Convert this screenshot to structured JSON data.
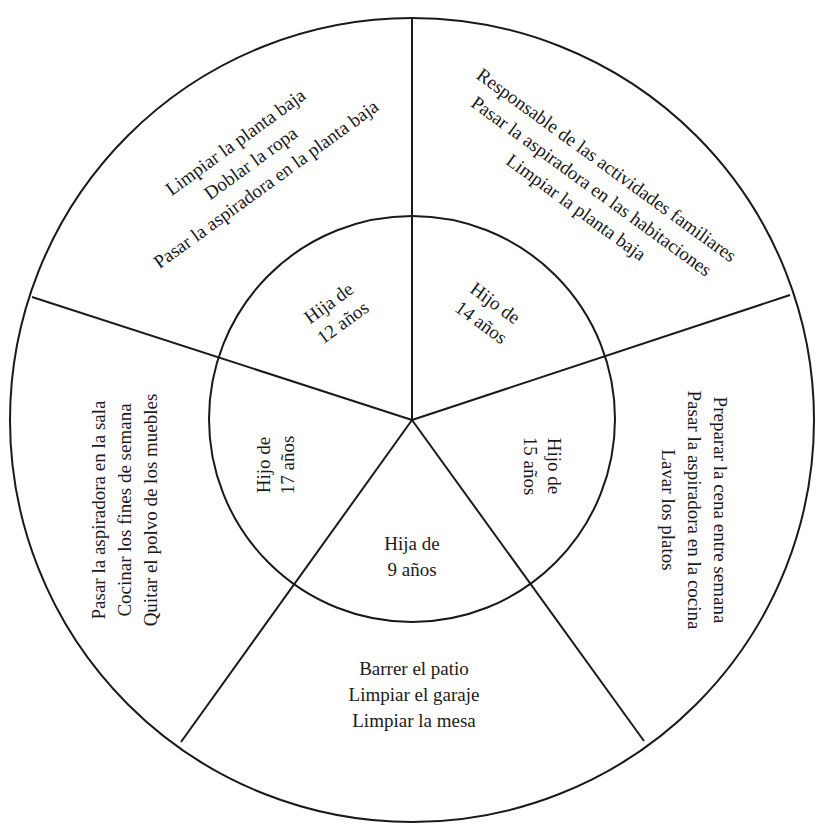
{
  "diagram": {
    "type": "chore-wheel",
    "center": {
      "x": 412,
      "y": 420
    },
    "outer_radius": 403,
    "inner_radius": 203,
    "line_color": "#1a1a1a",
    "background": "#ffffff",
    "divider_angles_deg": [
      0,
      72,
      144,
      216,
      288
    ],
    "segments": [
      {
        "child": {
          "line1": "Hija de",
          "line2": "12 años"
        },
        "tasks": [
          "Limpiar la planta baja",
          "Doblar la ropa",
          "Pasar la aspiradora en la planta baja"
        ]
      },
      {
        "child": {
          "line1": "Hijo de",
          "line2": "14 años"
        },
        "tasks": [
          "Responsable de las actividades familiares",
          "Pasar la aspiradora en las habitaciones",
          "Limpiar la planta baja"
        ]
      },
      {
        "child": {
          "line1": "Hijo de",
          "line2": "15 años"
        },
        "tasks": [
          "Preparar la cena entre semana",
          "Pasar la aspiradora en la cocina",
          "Lavar los platos"
        ]
      },
      {
        "child": {
          "line1": "Hija de",
          "line2": "9 años"
        },
        "tasks": [
          "Barrer el patio",
          "Limpiar el garaje",
          "Limpiar la mesa"
        ]
      },
      {
        "child": {
          "line1": "Hijo de",
          "line2": "17 años"
        },
        "tasks": [
          "Pasar la aspiradora en la sala",
          "Cocinar los fines de semana",
          "Quitar el polvo de los muebles"
        ]
      }
    ]
  }
}
